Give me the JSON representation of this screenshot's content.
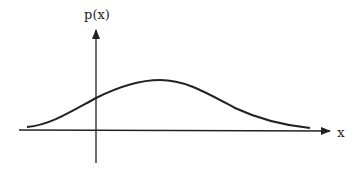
{
  "diagram": {
    "y_axis_label": "p(x)",
    "x_axis_label": "x",
    "curve": "bell-shaped probability density curve p(x), peak right of the vertical axis",
    "colors": {
      "ink": "#222222",
      "background": "#ffffff"
    }
  }
}
